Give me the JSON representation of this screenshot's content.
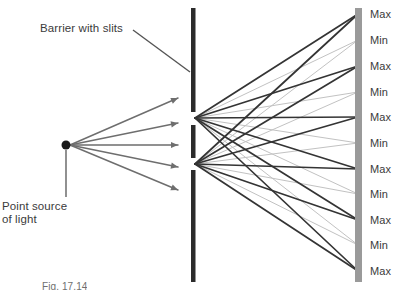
{
  "figure": {
    "caption_partial": "Fig. 17.14",
    "annotations": {
      "barrier_label": "Barrier with slits",
      "source_label_line1": "Point source",
      "source_label_line2": "of light"
    },
    "colors": {
      "barrier": "#2b2b2b",
      "screen": "#9a9a9a",
      "source_ray": "#6e6e6e",
      "max_ray": "#343434",
      "min_ray": "#c2c2c2",
      "text": "#3b3b3b",
      "background": "#ffffff"
    },
    "screen_labels": [
      {
        "text": "Max",
        "kind": "maximum",
        "y": 14
      },
      {
        "text": "Min",
        "kind": "minimum",
        "y": 40
      },
      {
        "text": "Max",
        "kind": "maximum",
        "y": 66
      },
      {
        "text": "Min",
        "kind": "minimum",
        "y": 92
      },
      {
        "text": "Max",
        "kind": "maximum",
        "y": 117
      },
      {
        "text": "Min",
        "kind": "minimum",
        "y": 143
      },
      {
        "text": "Max",
        "kind": "maximum",
        "y": 169
      },
      {
        "text": "Min",
        "kind": "minimum",
        "y": 194
      },
      {
        "text": "Max",
        "kind": "maximum",
        "y": 220
      },
      {
        "text": "Min",
        "kind": "minimum",
        "y": 245
      },
      {
        "text": "Max",
        "kind": "maximum",
        "y": 271
      }
    ],
    "geometry": {
      "source": {
        "x": 66,
        "y": 145,
        "r": 4.5
      },
      "barrier_x": 191,
      "barrier_segments": [
        {
          "y1": 8,
          "y2": 112
        },
        {
          "y1": 125,
          "y2": 158
        },
        {
          "y1": 170,
          "y2": 282
        }
      ],
      "slits": [
        {
          "x": 191,
          "y": 118
        },
        {
          "x": 191,
          "y": 164
        }
      ],
      "screen": {
        "x": 358,
        "y1": 8,
        "y2": 282,
        "width": 7
      },
      "source_rays": [
        {
          "x2": 178,
          "y2": 98
        },
        {
          "x2": 178,
          "y2": 123
        },
        {
          "x2": 178,
          "y2": 145
        },
        {
          "x2": 178,
          "y2": 167
        },
        {
          "x2": 178,
          "y2": 190
        }
      ],
      "pointer_line": {
        "x1": 133,
        "y1": 30,
        "x2": 190,
        "y2": 72
      },
      "source_leader": {
        "x1": 66,
        "y1": 150,
        "x2": 66,
        "y2": 197
      }
    }
  }
}
